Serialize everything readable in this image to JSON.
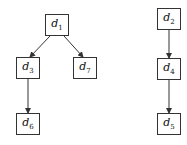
{
  "nodes": [
    {
      "id": "d1",
      "base": "d",
      "sub": "1",
      "x": 45,
      "y": 14
    },
    {
      "id": "d3",
      "base": "d",
      "sub": "3",
      "x": 16,
      "y": 57
    },
    {
      "id": "d7",
      "base": "d",
      "sub": "7",
      "x": 73,
      "y": 57
    },
    {
      "id": "d6",
      "base": "d",
      "sub": "6",
      "x": 16,
      "y": 113
    },
    {
      "id": "d2",
      "base": "d",
      "sub": "2",
      "x": 157,
      "y": 8
    },
    {
      "id": "d4",
      "base": "d",
      "sub": "4",
      "x": 157,
      "y": 58
    },
    {
      "id": "d5",
      "base": "d",
      "sub": "5",
      "x": 157,
      "y": 113
    }
  ],
  "edges": [
    {
      "from": "d1",
      "to": "d3"
    },
    {
      "from": "d1",
      "to": "d7"
    },
    {
      "from": "d3",
      "to": "d6"
    },
    {
      "from": "d2",
      "to": "d4"
    },
    {
      "from": "d4",
      "to": "d5"
    }
  ],
  "colors": {
    "stroke": "#333333",
    "background": "#ffffff"
  }
}
